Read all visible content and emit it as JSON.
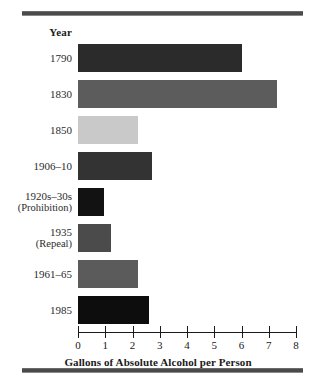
{
  "chart_data": {
    "type": "bar",
    "orientation": "horizontal",
    "title": "",
    "category_header": "Year",
    "categories": [
      "1790",
      "1830",
      "1850",
      "1906–10",
      "1920s–30s",
      "1935",
      "1961–65",
      "1985"
    ],
    "category_sublabels": [
      "",
      "",
      "",
      "",
      "(Prohibition)",
      "(Repeal)",
      "",
      ""
    ],
    "values": [
      6.0,
      7.3,
      2.2,
      2.7,
      0.95,
      1.2,
      2.2,
      2.6
    ],
    "bar_colors": [
      "#2b2b2b",
      "#5c5c5c",
      "#c9c9c9",
      "#333333",
      "#121212",
      "#4b4b4b",
      "#5b5b5b",
      "#0d0d0d"
    ],
    "xlabel": "Gallons of Absolute Alcohol per Person",
    "ylabel": "Year",
    "xlim": [
      0,
      8
    ],
    "xticks": [
      0,
      1,
      2,
      3,
      4,
      5,
      6,
      7,
      8
    ],
    "xtick_labels": [
      "0",
      "1",
      "2",
      "3",
      "4",
      "5",
      "6",
      "7",
      "8"
    ],
    "grid": false,
    "legend": null
  },
  "axis": {
    "x_label": "Gallons of Absolute Alcohol per Person"
  },
  "header": {
    "year_label": "Year"
  }
}
